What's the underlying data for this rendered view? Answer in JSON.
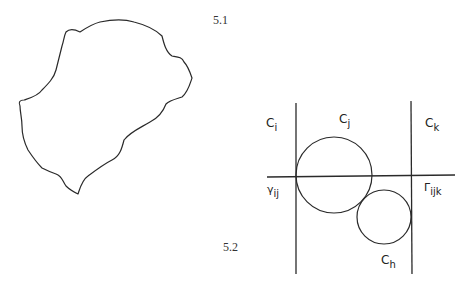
{
  "figures": [
    {
      "id": "5.1",
      "label": "5.1",
      "description": "Irregular closed curve (island-like outline)"
    },
    {
      "id": "5.2",
      "label": "5.2",
      "description": "Cells separated by boundary lines with two tangent circles",
      "labels": {
        "ci": {
          "base": "C",
          "sub": "i"
        },
        "cj": {
          "base": "C",
          "sub": "j"
        },
        "ck": {
          "base": "C",
          "sub": "k"
        },
        "ch": {
          "base": "C",
          "sub": "h"
        },
        "gamma_ij": {
          "base": "γ",
          "sub": "ij"
        },
        "Gamma_ijk": {
          "base": "Γ",
          "sub": "ijk"
        }
      }
    }
  ],
  "colors": {
    "stroke": "#2a2a2a",
    "background": "#ffffff"
  }
}
